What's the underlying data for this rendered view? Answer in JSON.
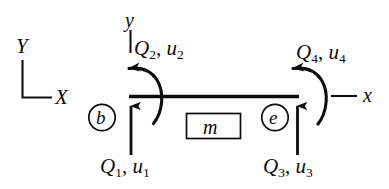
{
  "figure": {
    "type": "beam-element-free-body-diagram",
    "colors": {
      "ink": "#0d0d0d",
      "background": "#fefefe"
    }
  },
  "global_axes": {
    "y_label": "Y",
    "x_label": "X"
  },
  "local_axes": {
    "y_label": "y",
    "x_label": "x"
  },
  "element": {
    "label": "m"
  },
  "nodes": [
    {
      "label": "b",
      "name": "begin-node"
    },
    {
      "label": "e",
      "name": "end-node"
    }
  ],
  "dof_labels": [
    {
      "id": "q1",
      "force": "Q",
      "force_sub": "1",
      "disp": "u",
      "disp_sub": "1",
      "separator": ", "
    },
    {
      "id": "q2",
      "force": "Q",
      "force_sub": "2",
      "disp": "u",
      "disp_sub": "2",
      "separator": ", "
    },
    {
      "id": "q3",
      "force": "Q",
      "force_sub": "3",
      "disp": "u",
      "disp_sub": "3",
      "separator": ", "
    },
    {
      "id": "q4",
      "force": "Q",
      "force_sub": "4",
      "disp": "u",
      "disp_sub": "4",
      "separator": ", "
    }
  ]
}
